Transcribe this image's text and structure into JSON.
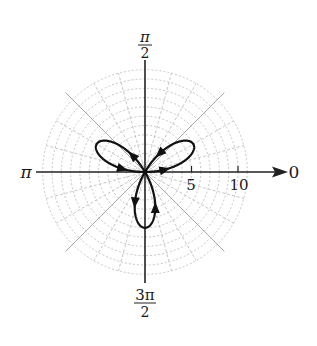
{
  "chart_data": {
    "type": "line",
    "subtype": "polar",
    "title": "",
    "curve": {
      "equation": "r = 6 sin(3θ)",
      "amplitude": 6,
      "petals": 3,
      "petal_directions_rad": [
        "π/6",
        "5π/6",
        "3π/2"
      ],
      "theta_range": [
        0,
        3.14159
      ],
      "direction_arrows": true,
      "color": "#111111"
    },
    "radial_axis": {
      "ticks": [
        5,
        10
      ],
      "tick_labels": [
        "5",
        "10"
      ],
      "max": 11
    },
    "angle_labels": {
      "zero": "0",
      "half_pi": "π",
      "half_pi_den": "2",
      "pi": "π",
      "three_half_pi_num": "3π",
      "three_half_pi_den": "2"
    },
    "grid": {
      "rings": 11,
      "ring_step": 1,
      "spoke_step_deg": 15,
      "color": "#b8b8b8"
    }
  }
}
